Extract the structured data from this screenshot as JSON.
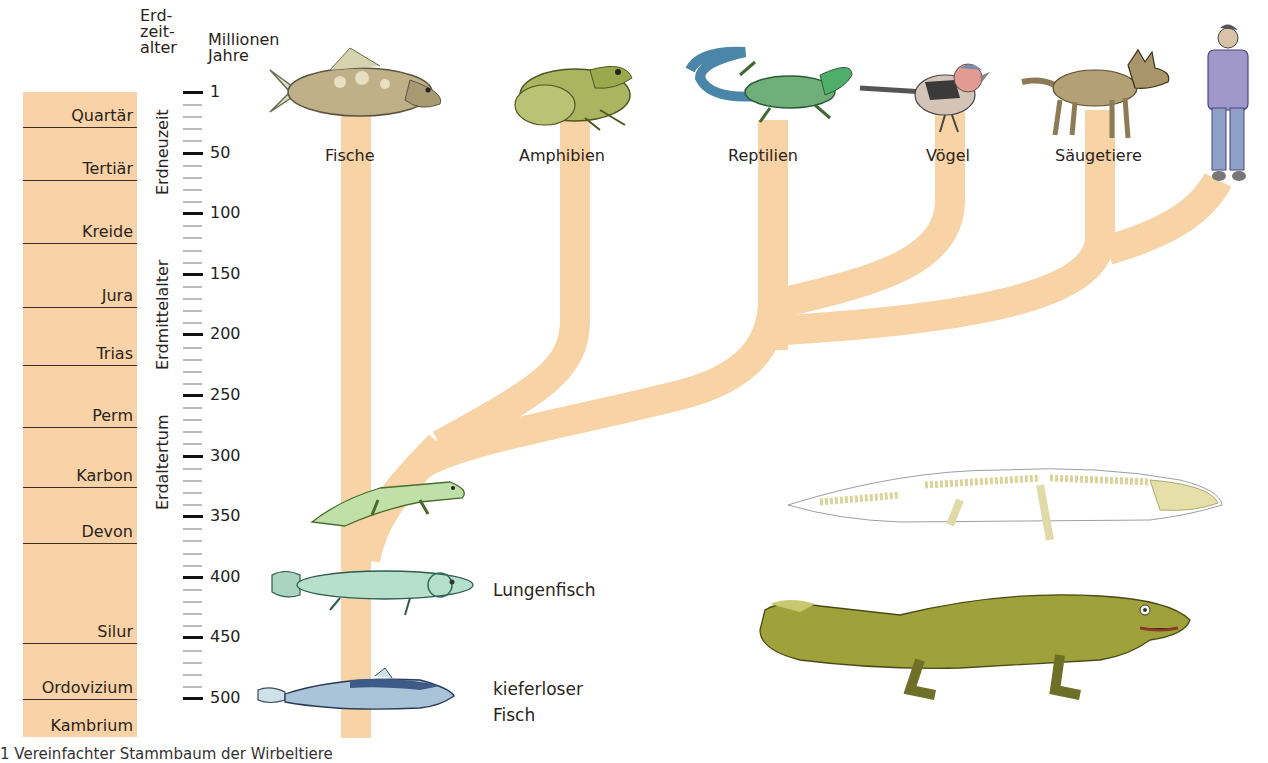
{
  "header": {
    "era_col": [
      "Erd-",
      "zeit-",
      "alter"
    ],
    "mya_col": [
      "Millionen",
      "Jahre"
    ]
  },
  "eras": [
    {
      "label": "Erdneuzeit",
      "top": 92,
      "bottom": 195
    },
    {
      "label": "Erdmittelalter",
      "top": 240,
      "bottom": 370
    },
    {
      "label": "Erdaltertum",
      "top": 400,
      "bottom": 510
    }
  ],
  "periods": [
    {
      "label": "Quartär",
      "bottom_y": 128
    },
    {
      "label": "Tertiär",
      "bottom_y": 181
    },
    {
      "label": "Kreide",
      "bottom_y": 244
    },
    {
      "label": "Jura",
      "bottom_y": 308
    },
    {
      "label": "Trias",
      "bottom_y": 366
    },
    {
      "label": "Perm",
      "bottom_y": 428
    },
    {
      "label": "Karbon",
      "bottom_y": 488
    },
    {
      "label": "Devon",
      "bottom_y": 544
    },
    {
      "label": "Silur",
      "bottom_y": 644
    },
    {
      "label": "Ordovizium",
      "bottom_y": 700
    },
    {
      "label": "Kambrium",
      "bottom_y": 737
    }
  ],
  "time_axis": {
    "unit": "Millionen Jahre",
    "major_ticks": [
      1,
      50,
      100,
      150,
      200,
      250,
      300,
      350,
      400,
      450,
      500
    ],
    "minor_per_major": 4
  },
  "groups": {
    "fische": "Fische",
    "amphibien": "Amphibien",
    "reptilien": "Reptilien",
    "voegel": "Vögel",
    "saeugetiere": "Säugetiere"
  },
  "side_labels": {
    "lungenfisch": "Lungenfisch",
    "kieferloser": [
      "kieferloser",
      "Fisch"
    ]
  },
  "colors": {
    "strata": "#f9d3a7",
    "tree": "#f8d3a6",
    "text": "#2a2420"
  },
  "caption": "1  Vereinfachter Stammbaum der Wirbeltiere"
}
